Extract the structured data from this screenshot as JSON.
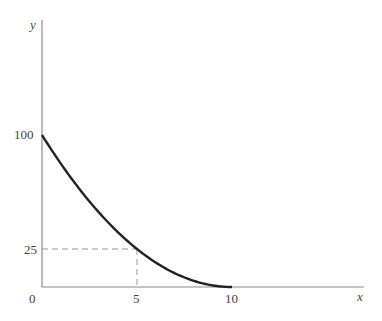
{
  "chart_data": {
    "type": "line",
    "title": "",
    "xlabel": "x",
    "ylabel": "y",
    "x_ticks": [
      "0",
      "5",
      "10"
    ],
    "y_ticks": [
      "25",
      "100"
    ],
    "xlim": [
      0,
      17
    ],
    "ylim": [
      0,
      140
    ],
    "grid": false,
    "legend": null,
    "series": [
      {
        "name": "y = (10 - x)^2",
        "x": [
          0,
          1,
          2,
          3,
          4,
          5,
          6,
          7,
          8,
          9,
          10
        ],
        "y": [
          100,
          81,
          64,
          49,
          36,
          25,
          16,
          9,
          4,
          1,
          0
        ]
      }
    ],
    "annotations": [
      {
        "type": "dashed-guide",
        "point": [
          5,
          25
        ],
        "description": "Dashed lines from (5,25) to both axes"
      }
    ]
  },
  "labels": {
    "y_axis": "y",
    "x_axis": "x",
    "origin": "0",
    "y100": "100",
    "y25": "25",
    "x5": "5",
    "x10": "10"
  },
  "colors": {
    "axis": "#888888",
    "curve": "#222222",
    "guide": "#999999"
  }
}
